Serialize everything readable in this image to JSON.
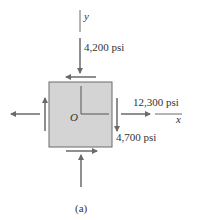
{
  "figure": {
    "axis_y_label": "y",
    "axis_x_label": "x",
    "origin_label": "O",
    "stress_top": "4,200 psi",
    "stress_right_normal": "12,300 psi",
    "stress_right_shear": "4,700 psi",
    "caption": "(a)",
    "colors": {
      "element_fill": "#d4d4d4",
      "element_stroke": "#6a6a6a",
      "arrow": "#6a6a6a",
      "text": "#333333"
    }
  }
}
